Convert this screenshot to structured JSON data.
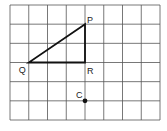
{
  "diagram": {
    "grid": {
      "columns": 8,
      "rows": 6,
      "x0": 10,
      "y0": 5,
      "x1": 160,
      "y1": 120,
      "line_color": "#555555"
    },
    "triangle": {
      "vertices": [
        {
          "label": "P",
          "col": 4,
          "row": 1
        },
        {
          "label": "Q",
          "col": 1,
          "row": 3
        },
        {
          "label": "R",
          "col": 4,
          "row": 3
        }
      ],
      "stroke_color": "#111111"
    },
    "point": {
      "label": "C",
      "col": 4,
      "row": 5
    },
    "labels": {
      "P": "P",
      "Q": "Q",
      "R": "R",
      "C": "C"
    }
  }
}
